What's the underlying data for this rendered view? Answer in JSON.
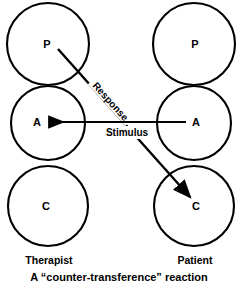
{
  "diagram": {
    "title_caption": "A “counter-transference” reaction",
    "columns": [
      {
        "name": "therapist",
        "label": "Therapist",
        "cx": 48
      },
      {
        "name": "patient",
        "label": "Patient",
        "cx": 194
      }
    ],
    "ego_states": [
      {
        "id": "therapist-parent",
        "label": "P",
        "column": "therapist",
        "cx": 48,
        "cy": 44,
        "r": 41
      },
      {
        "id": "therapist-adult",
        "label": "A",
        "column": "therapist",
        "cx": 48,
        "cy": 123,
        "r": 37
      },
      {
        "id": "therapist-child",
        "label": "C",
        "column": "therapist",
        "cx": 48,
        "cy": 206,
        "r": 40
      },
      {
        "id": "patient-parent",
        "label": "P",
        "column": "patient",
        "cx": 194,
        "cy": 44,
        "r": 41
      },
      {
        "id": "patient-adult",
        "label": "A",
        "column": "patient",
        "cx": 194,
        "cy": 123,
        "r": 37
      },
      {
        "id": "patient-child",
        "label": "C",
        "column": "patient",
        "cx": 194,
        "cy": 206,
        "r": 40
      }
    ],
    "transactions": [
      {
        "id": "stimulus",
        "label": "Stimulus",
        "from": "patient-adult",
        "to": "therapist-adult",
        "kind": "horizontal",
        "x1": 186,
        "y1": 122,
        "x2": 48,
        "y2": 122,
        "label_x": 127,
        "label_y": 136
      },
      {
        "id": "response",
        "label": "Response",
        "from": "therapist-parent",
        "to": "patient-child",
        "kind": "diagonal",
        "x1": 58,
        "y1": 49,
        "x2": 190,
        "y2": 197,
        "label_x": 92,
        "label_y": 86,
        "label_rotation": 48
      }
    ],
    "colors": {
      "stroke": "#000000",
      "fill": "#ffffff",
      "background": "#ffffff"
    }
  }
}
